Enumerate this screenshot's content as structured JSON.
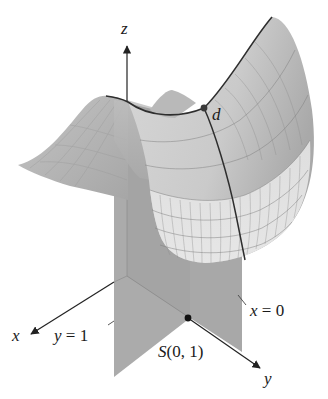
{
  "figure": {
    "type": "3d-surface-diagram",
    "axes": {
      "x": {
        "label": "x"
      },
      "y": {
        "label": "y"
      },
      "z": {
        "label": "z"
      }
    },
    "planes": [
      {
        "id": "plane-y1",
        "label": "y = 1"
      },
      {
        "id": "plane-x0",
        "label": "x = 0"
      }
    ],
    "points": [
      {
        "id": "point-d",
        "label": "d",
        "location": "on surface"
      },
      {
        "id": "point-S",
        "label": "S(0, 1)",
        "location": "in xy-plane"
      }
    ],
    "colors": {
      "background": "#ffffff",
      "surface_light": "#d8d8d8",
      "surface_mid": "#bdbdbd",
      "surface_dark": "#a3a3a3",
      "plane": "#a9a9a9",
      "plane_dark": "#9c9c9c",
      "grid": "#8a8a8a",
      "curve": "#2e2e2e",
      "axis": "#222222"
    }
  }
}
